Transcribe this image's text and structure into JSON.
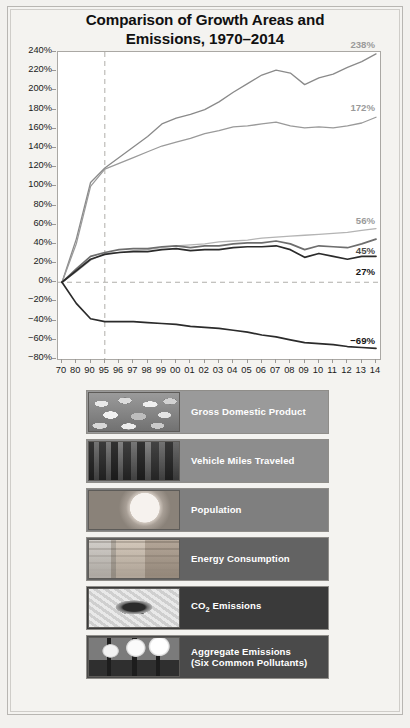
{
  "title": {
    "line1": "Comparison of Growth Areas and",
    "line2": "Emissions, 1970–2014"
  },
  "chart_data": {
    "type": "line",
    "title": "Comparison of Growth Areas and Emissions, 1970–2014",
    "xlabel": "",
    "ylabel": "",
    "ylim": [
      -80,
      240
    ],
    "ytick_step": 20,
    "grid": false,
    "legend_position": "below",
    "x": [
      "70",
      "80",
      "90",
      "95",
      "96",
      "97",
      "98",
      "99",
      "00",
      "01",
      "02",
      "03",
      "04",
      "05",
      "06",
      "07",
      "08",
      "09",
      "10",
      "11",
      "12",
      "13",
      "14"
    ],
    "ytick_labels": [
      "240%",
      "220%",
      "200%",
      "180%",
      "160%",
      "140%",
      "120%",
      "100%",
      "80%",
      "60%",
      "40%",
      "20%",
      "0%",
      "−20%",
      "−40%",
      "−60%",
      "−80%"
    ],
    "reference_lines": {
      "vertical_at": "95",
      "horizontal_at": 0
    },
    "series": [
      {
        "name": "Gross Domestic Product",
        "color": "#8a8a8a",
        "end_label": "238%",
        "values": [
          0,
          45,
          104,
          119,
          130,
          141,
          152,
          165,
          171,
          175,
          180,
          188,
          198,
          207,
          216,
          221,
          218,
          206,
          213,
          217,
          224,
          230,
          238
        ]
      },
      {
        "name": "Vehicle Miles Traveled",
        "color": "#9a9a9a",
        "end_label": "172%",
        "values": [
          0,
          40,
          100,
          118,
          124,
          130,
          136,
          142,
          146,
          150,
          155,
          158,
          162,
          163,
          165,
          167,
          163,
          161,
          162,
          161,
          163,
          166,
          172
        ]
      },
      {
        "name": "Population",
        "color": "#b4b4b4",
        "end_label": "56%",
        "values": [
          0,
          11,
          23,
          30,
          31,
          33,
          34,
          36,
          38,
          39,
          40,
          42,
          43,
          44,
          46,
          47,
          48,
          49,
          50,
          51,
          52,
          54,
          56
        ]
      },
      {
        "name": "Energy Consumption",
        "color": "#6e6e6e",
        "end_label": "45%",
        "values": [
          0,
          14,
          27,
          31,
          34,
          35,
          35,
          37,
          38,
          36,
          38,
          38,
          40,
          41,
          41,
          43,
          40,
          34,
          38,
          37,
          36,
          40,
          45
        ]
      },
      {
        "name": "CO₂ Emissions",
        "color": "#2b2b2b",
        "end_label": "27%",
        "values": [
          0,
          12,
          24,
          29,
          31,
          32,
          32,
          34,
          35,
          33,
          34,
          34,
          36,
          37,
          37,
          38,
          34,
          26,
          30,
          27,
          24,
          27,
          27
        ]
      },
      {
        "name": "Aggregate Emissions (Six Common Pollutants)",
        "color": "#2b2b2b",
        "end_label": "−69%",
        "values": [
          0,
          -22,
          -38,
          -41,
          -41,
          -41,
          -42,
          -43,
          -44,
          -46,
          -47,
          -48,
          -50,
          -52,
          -55,
          -57,
          -60,
          -63,
          -64,
          -65,
          -67,
          -68,
          -69
        ]
      }
    ]
  },
  "legend": {
    "items": [
      {
        "label": "Gross Domestic Product",
        "label2": "",
        "thumb": "coins-thumbnail-icon",
        "bg": "#9a9a9a"
      },
      {
        "label": "Vehicle Miles Traveled",
        "label2": "",
        "thumb": "traffic-thumbnail-icon",
        "bg": "#8d8d8d"
      },
      {
        "label": "Population",
        "label2": "",
        "thumb": "baby-thumbnail-icon",
        "bg": "#7f7f7f"
      },
      {
        "label": "Energy Consumption",
        "label2": "",
        "thumb": "light-switch-thumbnail-icon",
        "bg": "#636363"
      },
      {
        "label": "CO2 Emissions",
        "label2": "",
        "thumb": "tailpipe-thumbnail-icon",
        "bg": "#3a3a3a"
      },
      {
        "label": "Aggregate Emissions",
        "label2": "(Six Common Pollutants)",
        "thumb": "smokestacks-thumbnail-icon",
        "bg": "#4a4a4a"
      }
    ]
  }
}
